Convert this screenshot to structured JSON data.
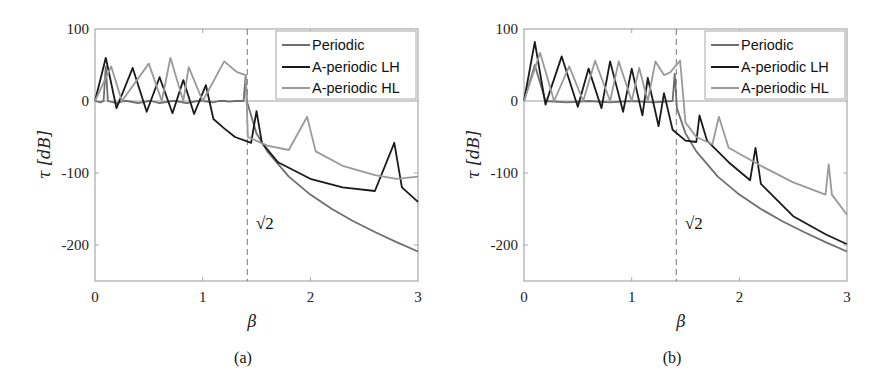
{
  "chart_data": [
    {
      "panel": "a",
      "caption": "(a)",
      "type": "line",
      "xlabel": "β",
      "ylabel": "τ [dB]",
      "xlim": [
        0,
        3
      ],
      "ylim": [
        -250,
        100
      ],
      "xticks": [
        "0",
        "1",
        "2",
        "3"
      ],
      "yticks": [
        "100",
        "0",
        "-100",
        "-200"
      ],
      "annotation": {
        "text": "√2",
        "x": 1.414,
        "y": -170,
        "vline_x": 1.414,
        "vline_style": "dashed"
      },
      "legend": {
        "position": "upper right",
        "entries": [
          "Periodic",
          "A-periodic LH",
          "A-periodic HL"
        ]
      },
      "series": [
        {
          "name": "Periodic",
          "color": "#6e6e6e",
          "points": [
            [
              0,
              0
            ],
            [
              0.05,
              -2
            ],
            [
              0.08,
              0
            ],
            [
              0.1,
              48
            ],
            [
              0.12,
              0
            ],
            [
              0.2,
              -3
            ],
            [
              0.27,
              0
            ],
            [
              0.3,
              0
            ],
            [
              0.4,
              -3
            ],
            [
              0.5,
              0
            ],
            [
              0.52,
              0
            ],
            [
              0.6,
              -3
            ],
            [
              0.72,
              0
            ],
            [
              0.75,
              0
            ],
            [
              0.85,
              -3
            ],
            [
              0.95,
              0
            ],
            [
              1.0,
              0
            ],
            [
              1.1,
              -2
            ],
            [
              1.15,
              0
            ],
            [
              1.2,
              0
            ],
            [
              1.25,
              -1
            ],
            [
              1.3,
              0
            ],
            [
              1.35,
              0
            ],
            [
              1.38,
              0
            ],
            [
              1.4,
              36
            ],
            [
              1.41,
              0
            ],
            [
              1.45,
              -20
            ],
            [
              1.5,
              -45
            ],
            [
              1.6,
              -70
            ],
            [
              1.8,
              -105
            ],
            [
              2.0,
              -130
            ],
            [
              2.2,
              -150
            ],
            [
              2.4,
              -167
            ],
            [
              2.6,
              -182
            ],
            [
              2.8,
              -196
            ],
            [
              3.0,
              -209
            ]
          ],
          "peaks": [
            [
              0.1,
              48
            ],
            [
              0.3,
              0
            ],
            [
              0.5,
              0
            ],
            [
              0.7,
              0
            ],
            [
              0.9,
              0
            ],
            [
              1.4,
              36
            ]
          ]
        },
        {
          "name": "A-periodic LH",
          "color": "#1a1a1a",
          "points": [
            [
              0,
              0
            ],
            [
              0.1,
              60
            ],
            [
              0.2,
              -10
            ],
            [
              0.35,
              46
            ],
            [
              0.48,
              -15
            ],
            [
              0.6,
              33
            ],
            [
              0.72,
              -17
            ],
            [
              0.82,
              29
            ],
            [
              0.92,
              -18
            ],
            [
              1.03,
              22
            ],
            [
              1.1,
              -25
            ],
            [
              1.2,
              -38
            ],
            [
              1.3,
              -50
            ],
            [
              1.45,
              -58
            ],
            [
              1.5,
              -14
            ],
            [
              1.55,
              -58
            ],
            [
              1.7,
              -85
            ],
            [
              2.0,
              -108
            ],
            [
              2.3,
              -120
            ],
            [
              2.6,
              -125
            ],
            [
              2.78,
              -58
            ],
            [
              2.85,
              -120
            ],
            [
              3.0,
              -140
            ]
          ],
          "peaks": [
            [
              0.1,
              60
            ],
            [
              0.35,
              46
            ],
            [
              0.6,
              33
            ],
            [
              0.82,
              29
            ],
            [
              1.03,
              22
            ],
            [
              1.5,
              -14
            ],
            [
              2.78,
              -58
            ]
          ]
        },
        {
          "name": "A-periodic HL",
          "color": "#9a9a9a",
          "points": [
            [
              0,
              0
            ],
            [
              0.15,
              48
            ],
            [
              0.25,
              0
            ],
            [
              0.5,
              52
            ],
            [
              0.62,
              0
            ],
            [
              0.7,
              60
            ],
            [
              0.82,
              0
            ],
            [
              0.87,
              47
            ],
            [
              1.0,
              0
            ],
            [
              1.2,
              55
            ],
            [
              1.32,
              40
            ],
            [
              1.4,
              36
            ],
            [
              1.42,
              -50
            ],
            [
              1.6,
              -62
            ],
            [
              1.8,
              -68
            ],
            [
              1.97,
              -22
            ],
            [
              2.05,
              -70
            ],
            [
              2.3,
              -90
            ],
            [
              2.6,
              -103
            ],
            [
              2.8,
              -108
            ],
            [
              3.0,
              -105
            ]
          ],
          "peaks": [
            [
              0.15,
              48
            ],
            [
              0.5,
              52
            ],
            [
              0.7,
              60
            ],
            [
              0.87,
              47
            ],
            [
              1.2,
              55
            ],
            [
              1.32,
              40
            ],
            [
              1.97,
              -22
            ]
          ]
        }
      ]
    },
    {
      "panel": "b",
      "caption": "(b)",
      "type": "line",
      "xlabel": "β",
      "ylabel": "τ [dB]",
      "xlim": [
        0,
        3
      ],
      "ylim": [
        -250,
        100
      ],
      "xticks": [
        "0",
        "1",
        "2",
        "3"
      ],
      "yticks": [
        "100",
        "0",
        "-100",
        "-200"
      ],
      "annotation": {
        "text": "√2",
        "x": 1.414,
        "y": -170,
        "vline_x": 1.414,
        "vline_style": "dashed"
      },
      "legend": {
        "position": "upper right",
        "entries": [
          "Periodic",
          "A-periodic LH",
          "A-periodic HL"
        ]
      },
      "series": [
        {
          "name": "Periodic",
          "color": "#6e6e6e",
          "points": [
            [
              0,
              0
            ],
            [
              0.1,
              50
            ],
            [
              0.2,
              0
            ],
            [
              0.4,
              -2
            ],
            [
              0.6,
              0
            ],
            [
              0.8,
              -2
            ],
            [
              1.0,
              0
            ],
            [
              1.2,
              -2
            ],
            [
              1.38,
              0
            ],
            [
              1.4,
              38
            ],
            [
              1.42,
              -10
            ],
            [
              1.5,
              -45
            ],
            [
              1.6,
              -70
            ],
            [
              1.8,
              -105
            ],
            [
              2.0,
              -130
            ],
            [
              2.2,
              -150
            ],
            [
              2.4,
              -167
            ],
            [
              2.6,
              -182
            ],
            [
              2.8,
              -196
            ],
            [
              3.0,
              -209
            ]
          ],
          "peaks": [
            [
              0.1,
              50
            ],
            [
              1.4,
              38
            ]
          ]
        },
        {
          "name": "A-periodic LH",
          "color": "#1a1a1a",
          "points": [
            [
              0,
              0
            ],
            [
              0.1,
              82
            ],
            [
              0.2,
              -5
            ],
            [
              0.35,
              62
            ],
            [
              0.5,
              -8
            ],
            [
              0.6,
              45
            ],
            [
              0.72,
              -10
            ],
            [
              0.8,
              55
            ],
            [
              0.92,
              -15
            ],
            [
              1.0,
              45
            ],
            [
              1.1,
              -20
            ],
            [
              1.15,
              32
            ],
            [
              1.25,
              -35
            ],
            [
              1.3,
              11
            ],
            [
              1.38,
              -40
            ],
            [
              1.5,
              -55
            ],
            [
              1.6,
              -57
            ],
            [
              1.63,
              -20
            ],
            [
              1.7,
              -55
            ],
            [
              1.9,
              -85
            ],
            [
              2.1,
              -110
            ],
            [
              2.15,
              -65
            ],
            [
              2.2,
              -115
            ],
            [
              2.5,
              -160
            ],
            [
              2.8,
              -185
            ],
            [
              3.0,
              -199
            ]
          ],
          "peaks": [
            [
              0.1,
              82
            ],
            [
              0.35,
              62
            ],
            [
              0.6,
              45
            ],
            [
              0.8,
              55
            ],
            [
              1.0,
              45
            ],
            [
              1.15,
              32
            ],
            [
              1.3,
              11
            ],
            [
              1.63,
              -20
            ],
            [
              2.15,
              -65
            ]
          ]
        },
        {
          "name": "A-periodic HL",
          "color": "#9a9a9a",
          "points": [
            [
              0,
              0
            ],
            [
              0.15,
              67
            ],
            [
              0.28,
              0
            ],
            [
              0.42,
              48
            ],
            [
              0.55,
              0
            ],
            [
              0.66,
              56
            ],
            [
              0.8,
              0
            ],
            [
              0.88,
              55
            ],
            [
              1.0,
              0
            ],
            [
              1.07,
              46
            ],
            [
              1.15,
              0
            ],
            [
              1.22,
              55
            ],
            [
              1.3,
              36
            ],
            [
              1.36,
              40
            ],
            [
              1.45,
              56
            ],
            [
              1.5,
              -30
            ],
            [
              1.6,
              -50
            ],
            [
              1.75,
              -60
            ],
            [
              1.81,
              -22
            ],
            [
              1.9,
              -65
            ],
            [
              2.2,
              -90
            ],
            [
              2.5,
              -113
            ],
            [
              2.8,
              -130
            ],
            [
              2.83,
              -88
            ],
            [
              2.86,
              -130
            ],
            [
              3.0,
              -158
            ]
          ],
          "peaks": [
            [
              0.15,
              67
            ],
            [
              0.42,
              48
            ],
            [
              0.66,
              56
            ],
            [
              0.88,
              55
            ],
            [
              1.22,
              55
            ],
            [
              1.45,
              56
            ],
            [
              1.81,
              -22
            ],
            [
              2.83,
              -88
            ]
          ]
        }
      ]
    }
  ],
  "panels": {
    "a": {
      "caption": "(a)",
      "xlabel": "β",
      "ylabel": "τ [dB]",
      "sqrt_label": "√2",
      "legend": [
        "Periodic",
        "A-periodic LH",
        "A-periodic HL"
      ],
      "xticks": [
        "0",
        "1",
        "2",
        "3"
      ],
      "yticks": [
        "100",
        "0",
        "-100",
        "-200"
      ]
    },
    "b": {
      "caption": "(b)",
      "xlabel": "β",
      "ylabel": "τ [dB]",
      "sqrt_label": "√2",
      "legend": [
        "Periodic",
        "A-periodic LH",
        "A-periodic HL"
      ],
      "xticks": [
        "0",
        "1",
        "2",
        "3"
      ],
      "yticks": [
        "100",
        "0",
        "-100",
        "-200"
      ]
    }
  },
  "colors": {
    "periodic": "#6e6e6e",
    "lh": "#1a1a1a",
    "hl": "#9a9a9a",
    "axis": "#9c9c9c"
  }
}
